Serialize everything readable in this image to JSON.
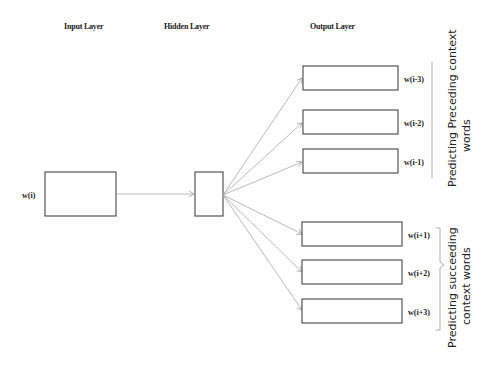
{
  "headers": {
    "input": "Input Layer",
    "hidden": "Hidden Layer",
    "output": "Output Layer"
  },
  "input": {
    "label": "w(i)"
  },
  "outputs": [
    {
      "label": "w(i-3)"
    },
    {
      "label": "w(i-2)"
    },
    {
      "label": "w(i-1)"
    },
    {
      "label": "w(i+1)"
    },
    {
      "label": "w(i+2)"
    },
    {
      "label": "w(i+3)"
    }
  ],
  "groups": {
    "preceding": {
      "line1": "Predicting Preceding context",
      "line2": "words"
    },
    "succeeding": {
      "line1": "Predicting  succeeding",
      "line2": "context words"
    }
  },
  "colors": {
    "box_stroke": "#555555",
    "edge": "#a8a8a8",
    "text": "#222222"
  }
}
